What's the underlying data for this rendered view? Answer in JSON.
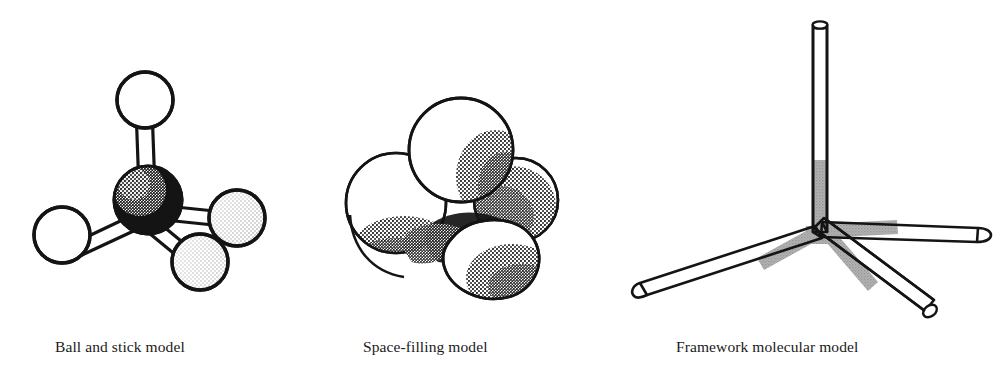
{
  "figure": {
    "background_color": "#ffffff",
    "ink_color": "#141414",
    "gray_fill_color": "#a8a8a8",
    "sphere_fill_color": "#ffffff",
    "carbon_fill_color": "#141414"
  },
  "panels": [
    {
      "id": "ball-and-stick",
      "caption": "Ball and stick model",
      "caption_x": 55,
      "caption_y": 338,
      "model_type": "ball-and-stick",
      "atoms": [
        {
          "label": "carbon",
          "role": "center",
          "cx": 148,
          "cy": 200,
          "r": 34,
          "shade": "dark"
        },
        {
          "label": "hydrogen",
          "role": "top",
          "cx": 145,
          "cy": 100,
          "r": 28,
          "shade": "light"
        },
        {
          "label": "hydrogen",
          "role": "left",
          "cx": 62,
          "cy": 235,
          "r": 28,
          "shade": "light"
        },
        {
          "label": "hydrogen",
          "role": "right",
          "cx": 237,
          "cy": 218,
          "r": 28,
          "shade": "light"
        },
        {
          "label": "hydrogen",
          "role": "bottom-right",
          "cx": 200,
          "cy": 262,
          "r": 28,
          "shade": "light"
        }
      ],
      "bonds": [
        {
          "from": "carbon",
          "to": "top"
        },
        {
          "from": "carbon",
          "to": "left"
        },
        {
          "from": "carbon",
          "to": "right"
        },
        {
          "from": "carbon",
          "to": "bottom-right"
        }
      ]
    },
    {
      "id": "space-filling",
      "caption": "Space-filling model",
      "caption_x": 363,
      "caption_y": 338,
      "model_type": "space-filling",
      "spheres": [
        {
          "label": "hydrogen-back-left",
          "cx": 396,
          "cy": 203,
          "r": 50
        },
        {
          "label": "hydrogen-top",
          "cx": 461,
          "cy": 150,
          "r": 52
        },
        {
          "label": "hydrogen-right",
          "cx": 516,
          "cy": 200,
          "r": 42
        },
        {
          "label": "hydrogen-front",
          "cx": 487,
          "cy": 240,
          "r": 55
        },
        {
          "label": "carbon-core",
          "cx": 448,
          "cy": 218,
          "r": 50
        }
      ]
    },
    {
      "id": "framework",
      "caption": "Framework molecular model",
      "caption_x": 676,
      "caption_y": 338,
      "model_type": "framework",
      "center": {
        "x": 820,
        "y": 230
      },
      "rods": [
        {
          "label": "rod-up",
          "end_x": 820,
          "end_y": 22,
          "width": 13,
          "gray_length": 70,
          "cap": "open-ellipse"
        },
        {
          "label": "rod-lower-left",
          "end_x": 632,
          "end_y": 292,
          "width": 13,
          "gray_length": 75,
          "cap": "rounded"
        },
        {
          "label": "rod-right",
          "end_x": 985,
          "end_y": 237,
          "width": 13,
          "gray_length": 78,
          "cap": "rounded"
        },
        {
          "label": "rod-lower-right",
          "end_x": 936,
          "end_y": 322,
          "width": 13,
          "gray_length": 75,
          "cap": "open-ellipse"
        }
      ]
    }
  ]
}
